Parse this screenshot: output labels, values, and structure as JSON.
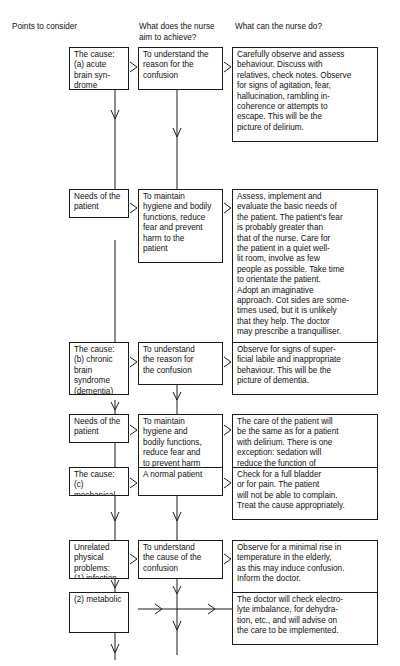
{
  "document": {
    "title": "Nursing care flowchart for the confused patient",
    "background_color": "#ffffff",
    "line_color": "#1b1b1b",
    "text_color": "#111111"
  },
  "headers": [
    {
      "id": "col1",
      "label": "Points to consider"
    },
    {
      "id": "col2",
      "label": "What does the nurse\naim to achieve?"
    },
    {
      "id": "col3",
      "label": "What can the nurse do?"
    }
  ],
  "rows": [
    {
      "id": "row-1-delirium",
      "points": "The cause:\n(a) acute brain syn-\n        drome (delirium)",
      "aim": "To understand the\nreason for the\nconfusion",
      "action": "Carefully observe and assess\nbehaviour. Discuss with\nrelatives, check notes. Observe\nfor signs of agitation, fear,\nhallucination, rambling in-\ncoherence or attempts to\nescape. This will be the\npicture of delirium."
    },
    {
      "id": "row-2-needs-delirium",
      "points": "Needs of the\npatient",
      "aim": "To maintain\nhygiene and bodily\nfunctions, reduce\nfear and prevent\nharm to the\npatient",
      "action": "Assess, implement and\nevaluate the basic needs of\nthe patient. The patient's fear\nis probably greater than\nthat of the nurse. Care for\nthe patient in a quiet well-\nlit room, involve as few\npeople as possible. Take time\nto orientate the patient.\nAdopt an imaginative\napproach. Cot sides are some-\ntimes used, but it is unlikely\nthat they help. The doctor\nmay prescribe a tranquilliser."
    },
    {
      "id": "row-3-dementia",
      "points": "The cause:\n(b) chronic brain\n        syndrome\n        (dementia)",
      "aim": "To understand\nthe reason for\nthe confusion",
      "action": "Observe for signs of super-\nficial labile and inappropriate\nbehaviour. This will be the\npicture of dementia."
    },
    {
      "id": "row-4-needs-dementia",
      "points": "Needs of the\npatient",
      "aim": "To maintain\nhygiene and\nbodily functions,\nreduce fear and\nto prevent harm\nto the patient",
      "action": "The care of the patient will\nbe the same as for a patient\nwith delirium. There is one\nexception: sedation will\nreduce the function of\nalready-damaged brain cells."
    },
    {
      "id": "row-5-mechanical",
      "points": "The cause:\n(c) mechanical",
      "aim": "A normal patient",
      "action": "Check for a full bladder\nor for pain. The patient\nwill not be able to complain.\nTreat the cause appropriately."
    },
    {
      "id": "row-6-infection",
      "points": "Unrelated physical\nproblems:\n(1) infection",
      "aim": "To understand\nthe cause of the\nconfusion",
      "action": "Observe for a minimal rise in\ntemperature in the elderly,\nas this may induce confusion.\nInform the doctor."
    },
    {
      "id": "row-7-metabolic",
      "points": "(2) metabolic",
      "aim": "",
      "action": "The doctor will check electro-\nlyte imbalance, for dehydra-\ntion, etc., and will advise on\nthe care to be implemented."
    }
  ],
  "connectors": {
    "horizontal_arrow_glyph": "chevron-right-arrow",
    "vertical_arrow_glyph": "chevron-down-arrow"
  }
}
